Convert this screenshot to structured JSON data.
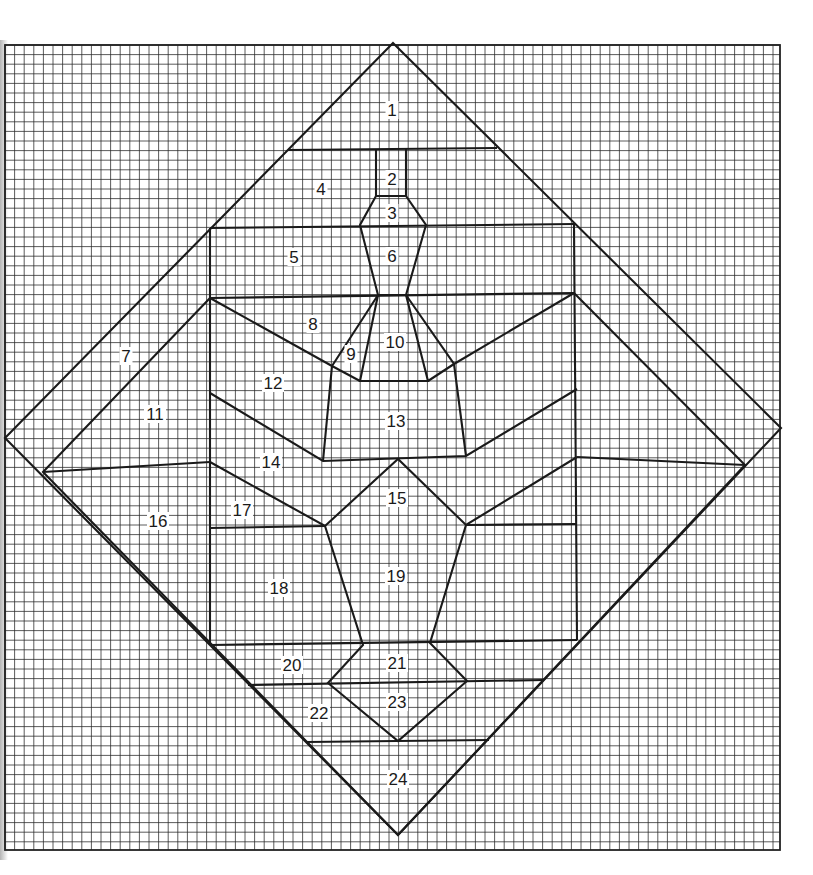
{
  "diagram": {
    "type": "quilt-pattern-grid",
    "canvas": {
      "width": 813,
      "height": 875
    },
    "grid": {
      "left": 5,
      "top": 45,
      "right": 780,
      "bottom": 850,
      "spacing": 9.6
    },
    "colors": {
      "line": "#1a1a1a",
      "grid": "#2a2a2a",
      "background": "#ffffff"
    },
    "outer_diamond": [
      [
        393,
        43
      ],
      [
        781,
        428
      ],
      [
        398,
        835
      ],
      [
        5,
        438
      ]
    ],
    "seams": [
      [
        [
          288,
          150
        ],
        [
          497,
          148
        ]
      ],
      [
        [
          376,
          150
        ],
        [
          376,
          196
        ]
      ],
      [
        [
          406,
          148
        ],
        [
          406,
          196
        ]
      ],
      [
        [
          376,
          196
        ],
        [
          406,
          196
        ],
        [
          426,
          225
        ],
        [
          406,
          295
        ],
        [
          378,
          295
        ],
        [
          360,
          225
        ],
        [
          376,
          196
        ]
      ],
      [
        [
          210,
          228
        ],
        [
          574,
          224
        ]
      ],
      [
        [
          210,
          228
        ],
        [
          210,
          645
        ]
      ],
      [
        [
          574,
          224
        ],
        [
          577,
          640
        ]
      ],
      [
        [
          210,
          298
        ],
        [
          574,
          293
        ]
      ],
      [
        [
          210,
          298
        ],
        [
          332,
          366
        ]
      ],
      [
        [
          574,
          293
        ],
        [
          454,
          364
        ]
      ],
      [
        [
          378,
          295
        ],
        [
          332,
          366
        ],
        [
          323,
          461
        ]
      ],
      [
        [
          406,
          295
        ],
        [
          454,
          364
        ],
        [
          466,
          456
        ]
      ],
      [
        [
          378,
          295
        ],
        [
          360,
          381
        ],
        [
          428,
          381
        ],
        [
          406,
          295
        ]
      ],
      [
        [
          360,
          381
        ],
        [
          332,
          366
        ]
      ],
      [
        [
          428,
          381
        ],
        [
          454,
          364
        ]
      ],
      [
        [
          210,
          298
        ],
        [
          43,
          472
        ],
        [
          398,
          835
        ],
        [
          745,
          465
        ],
        [
          574,
          293
        ]
      ],
      [
        [
          43,
          472
        ],
        [
          210,
          462
        ]
      ],
      [
        [
          577,
          457
        ],
        [
          745,
          465
        ]
      ],
      [
        [
          210,
          393
        ],
        [
          323,
          461
        ],
        [
          466,
          456
        ],
        [
          577,
          389
        ]
      ],
      [
        [
          210,
          462
        ],
        [
          325,
          526
        ],
        [
          398,
          459
        ],
        [
          466,
          525
        ],
        [
          577,
          457
        ]
      ],
      [
        [
          210,
          528
        ],
        [
          325,
          526
        ]
      ],
      [
        [
          466,
          525
        ],
        [
          577,
          524
        ]
      ],
      [
        [
          325,
          526
        ],
        [
          363,
          645
        ],
        [
          328,
          683
        ],
        [
          398,
          741
        ],
        [
          467,
          681
        ],
        [
          430,
          643
        ],
        [
          466,
          525
        ]
      ],
      [
        [
          210,
          645
        ],
        [
          577,
          640
        ]
      ],
      [
        [
          248,
          685
        ],
        [
          544,
          680
        ]
      ],
      [
        [
          306,
          742
        ],
        [
          489,
          740
        ]
      ]
    ],
    "labels": [
      {
        "n": "1",
        "x": 392,
        "y": 110
      },
      {
        "n": "2",
        "x": 392,
        "y": 179
      },
      {
        "n": "3",
        "x": 392,
        "y": 213
      },
      {
        "n": "4",
        "x": 321,
        "y": 189
      },
      {
        "n": "5",
        "x": 294,
        "y": 257
      },
      {
        "n": "6",
        "x": 392,
        "y": 256
      },
      {
        "n": "7",
        "x": 126,
        "y": 356
      },
      {
        "n": "8",
        "x": 313,
        "y": 324
      },
      {
        "n": "9",
        "x": 351,
        "y": 354
      },
      {
        "n": "10",
        "x": 395,
        "y": 342
      },
      {
        "n": "11",
        "x": 155,
        "y": 414
      },
      {
        "n": "12",
        "x": 273,
        "y": 383
      },
      {
        "n": "13",
        "x": 396,
        "y": 421
      },
      {
        "n": "14",
        "x": 271,
        "y": 462
      },
      {
        "n": "15",
        "x": 397,
        "y": 498
      },
      {
        "n": "16",
        "x": 158,
        "y": 521
      },
      {
        "n": "17",
        "x": 242,
        "y": 510
      },
      {
        "n": "18",
        "x": 279,
        "y": 588
      },
      {
        "n": "19",
        "x": 396,
        "y": 576
      },
      {
        "n": "20",
        "x": 292,
        "y": 665
      },
      {
        "n": "21",
        "x": 397,
        "y": 663
      },
      {
        "n": "22",
        "x": 319,
        "y": 713
      },
      {
        "n": "23",
        "x": 397,
        "y": 702
      },
      {
        "n": "24",
        "x": 398,
        "y": 779
      }
    ]
  }
}
